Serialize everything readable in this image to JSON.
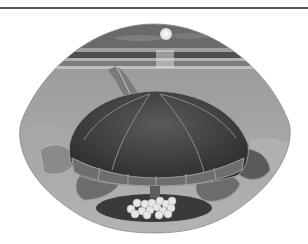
{
  "image": {
    "subject": "Sea turtle laying eggs on a moonlit beach",
    "style": "grayscale illustration in oval frame",
    "elements": [
      "moon",
      "night-sky",
      "sea",
      "sand",
      "flipper-track",
      "turtle-shell",
      "flippers",
      "eggs"
    ]
  },
  "colors": {
    "rule": "#5a5a5a",
    "sky": "#6e6e6e",
    "moon": "#f4f4f4",
    "sea_dark": "#4a4a4a",
    "sea_light": "#a8a8a8",
    "sand": "#9a9a9a",
    "shell": "#3e3e3e",
    "shell_edge": "#8a8a8a",
    "egg": "#e6e6e6"
  },
  "egg_count": 16
}
